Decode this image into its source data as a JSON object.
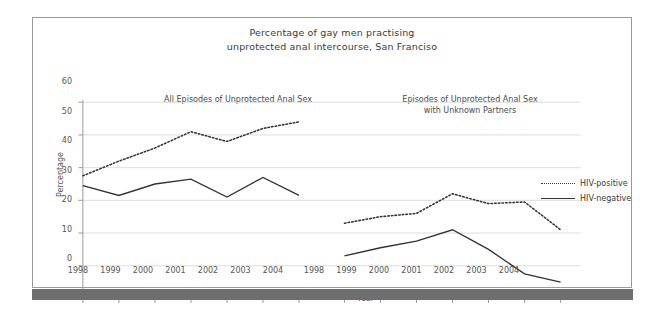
{
  "chart_data": {
    "type": "line",
    "title": "Percentage of gay men practising unprotected anal intercourse, San Franciso",
    "title_lines": [
      "Percentage of gay men practising",
      "unprotected anal intercourse, San Franciso"
    ],
    "xlabel": "Year",
    "ylabel": "Percentage",
    "ylim": [
      0,
      60
    ],
    "yticks": [
      0,
      10,
      20,
      30,
      40,
      50,
      60
    ],
    "grid": true,
    "legend_position": "right",
    "legend": [
      {
        "name": "HIV-positive",
        "style": "dotted"
      },
      {
        "name": "HIV-negative",
        "style": "solid"
      }
    ],
    "panels": [
      {
        "caption": "All Episodes of Unprotected Anal Sex",
        "caption_lines": [
          "All Episodes of Unprotected Anal Sex"
        ],
        "categories": [
          "1998",
          "1999",
          "2000",
          "2001",
          "2002",
          "2003",
          "2004"
        ],
        "series": [
          {
            "name": "HIV-positive",
            "style": "dotted",
            "values": [
              37.5,
              42,
              46,
              51,
              48,
              52,
              54
            ]
          },
          {
            "name": "HIV-negative",
            "style": "solid",
            "values": [
              34.5,
              31.5,
              35,
              36.5,
              31,
              37,
              31.5
            ]
          }
        ]
      },
      {
        "caption": "Episodes of Unprotected Anal Sex with Unknown Partners",
        "caption_lines": [
          "Episodes of Unprotected Anal Sex",
          "with Unknown Partners"
        ],
        "categories": [
          "1998",
          "1999",
          "2000",
          "2001",
          "2002",
          "2003",
          "2004"
        ],
        "series": [
          {
            "name": "HIV-positive",
            "style": "dotted",
            "values": [
              23,
              25,
              26,
              32,
              29,
              29.5,
              21
            ]
          },
          {
            "name": "HIV-negative",
            "style": "solid",
            "values": [
              13,
              15.5,
              17.5,
              21,
              15,
              7.5,
              5
            ]
          }
        ]
      }
    ]
  }
}
